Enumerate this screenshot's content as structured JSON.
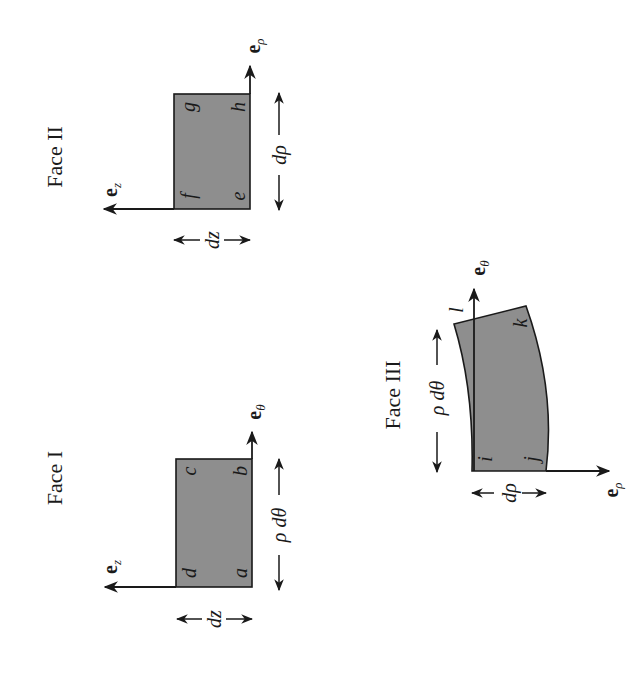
{
  "figure": {
    "orientation": "rotated 90 degrees counter-clockwise",
    "face_fill_color": "#8e8e8e",
    "line_color": "#1a1a1a",
    "faces": [
      {
        "id": "face-1",
        "title": "Face I",
        "corners": [
          "a",
          "b",
          "c",
          "d"
        ],
        "axis_horizontal": {
          "base": "e",
          "sub": "z"
        },
        "axis_vertical": {
          "base": "e",
          "sub": "θ"
        },
        "dim_short": "dz",
        "dim_long": "ρ dθ"
      },
      {
        "id": "face-2",
        "title": "Face II",
        "corners": [
          "e",
          "h",
          "g",
          "f"
        ],
        "axis_horizontal": {
          "base": "e",
          "sub": "z"
        },
        "axis_vertical": {
          "base": "e",
          "sub": "ρ"
        },
        "dim_short": "dz",
        "dim_long": "dρ"
      },
      {
        "id": "face-3",
        "title": "Face III",
        "corners": [
          "i",
          "j",
          "k",
          "l"
        ],
        "axis_horizontal": {
          "base": "e",
          "sub": "ρ"
        },
        "axis_vertical": {
          "base": "e",
          "sub": "θ"
        },
        "dim_short": "dρ",
        "dim_long": "ρ dθ"
      }
    ]
  }
}
